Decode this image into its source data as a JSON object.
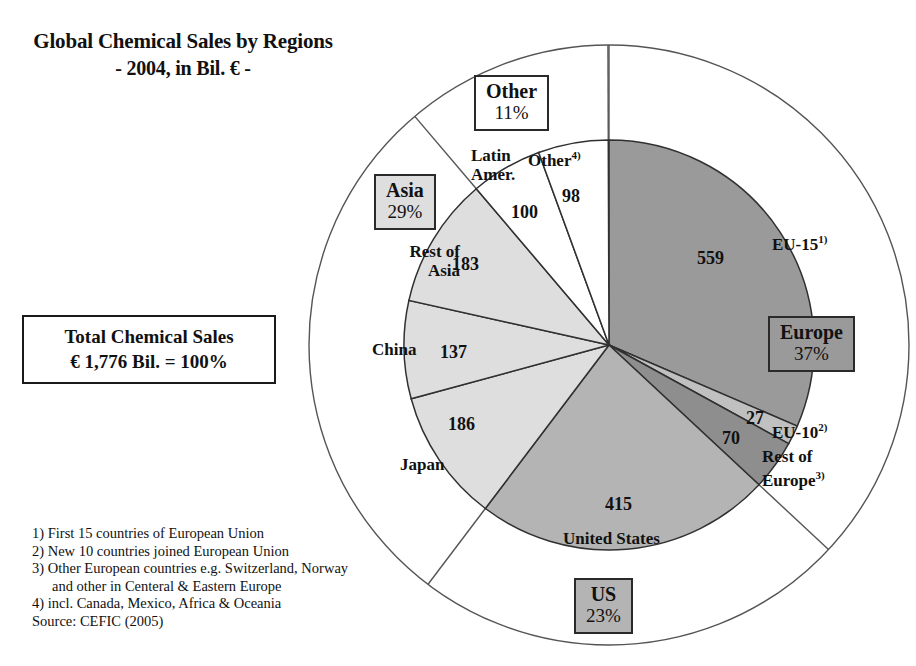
{
  "title": {
    "line1": "Global Chemical Sales by Regions",
    "line2": "- 2004, in Bil. € -"
  },
  "total_box": {
    "line1": "Total Chemical Sales",
    "line2": "€ 1,776 Bil. = 100%"
  },
  "footnotes": {
    "f1": "1) First 15 countries of European Union",
    "f2": "2) New 10 countries joined European Union",
    "f3a": "3) Other European countries e.g. Switzerland, Norway",
    "f3b": "and other in Centeral & Eastern Europe",
    "f4": "4) incl. Canada, Mexico, Africa & Oceania",
    "source": "Source: CEFIC (2005)"
  },
  "groups": [
    {
      "name": "Europe",
      "percent": "37%",
      "color": "#9a9a9a"
    },
    {
      "name": "US",
      "percent": "23%",
      "color": "#b4b4b4"
    },
    {
      "name": "Asia",
      "percent": "29%",
      "color": "#dedede"
    },
    {
      "name": "Other",
      "percent": "11%",
      "color": "#ffffff"
    }
  ],
  "labels": {
    "eu15": "EU-15",
    "eu15_sup": "1)",
    "eu10": "EU-10",
    "eu10_sup": "2)",
    "rest_europe_l1": "Rest of",
    "rest_europe_l2": "Europe",
    "rest_europe_sup": "3)",
    "united_states": "United States",
    "japan": "Japan",
    "china": "China",
    "rest_asia_l1": "Rest of",
    "rest_asia_l2": "Asia",
    "latin_l1": "Latin",
    "latin_l2": "Amer.",
    "other": "Other",
    "other_sup": "4)"
  },
  "chart_data": {
    "type": "pie",
    "title": "Global Chemical Sales by Regions - 2004, in Bil. € -",
    "unit": "Bil. €",
    "total": 1776,
    "total_label": "€ 1,776 Bil. = 100%",
    "start_angle_deg": 0,
    "direction": "clockwise",
    "legend_position": "outer-ring",
    "grid": false,
    "categories": [
      "EU-15",
      "EU-10",
      "Rest of Europe",
      "United States",
      "Japan",
      "China",
      "Rest of Asia",
      "Latin Amer.",
      "Other"
    ],
    "values": [
      559,
      27,
      70,
      415,
      186,
      137,
      183,
      100,
      98
    ],
    "colors": [
      "#9a9a9a",
      "#c0c0c0",
      "#8e8e8e",
      "#b4b4b4",
      "#dedede",
      "#dedede",
      "#dedede",
      "#ffffff",
      "#ffffff"
    ],
    "groups": [
      {
        "name": "Europe",
        "percent": 37,
        "members": [
          "EU-15",
          "EU-10",
          "Rest of Europe"
        ],
        "value": 656
      },
      {
        "name": "US",
        "percent": 23,
        "members": [
          "United States"
        ],
        "value": 415
      },
      {
        "name": "Asia",
        "percent": 29,
        "members": [
          "Japan",
          "China",
          "Rest of Asia"
        ],
        "value": 506
      },
      {
        "name": "Other",
        "percent": 11,
        "members": [
          "Latin Amer.",
          "Other"
        ],
        "value": 198
      }
    ],
    "annotations": [
      "1) First 15 countries of European Union",
      "2) New 10 countries joined European Union",
      "3) Other European countries e.g. Switzerland, Norway and other in Centeral & Eastern Europe",
      "4) incl. Canada, Mexico, Africa & Oceania",
      "Source: CEFIC (2005)"
    ]
  },
  "values_text": {
    "eu15": "559",
    "eu10": "27",
    "rest_europe": "70",
    "united_states": "415",
    "japan": "186",
    "china": "137",
    "rest_asia": "183",
    "latin": "100",
    "other": "98"
  }
}
